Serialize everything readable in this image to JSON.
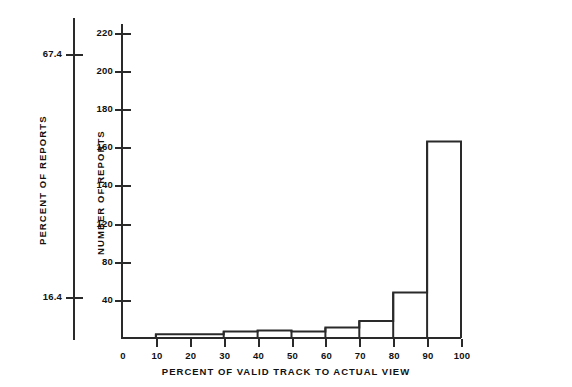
{
  "chart_data": {
    "type": "bar",
    "title": "",
    "subtitle": "",
    "xlabel": "PERCENT OF VALID TRACK TO ACTUAL VIEW",
    "ylabel": "NUMBER OF REPORTS",
    "secondary_ylabel": "PERCENT OF REPORTS",
    "grid": false,
    "legend": null,
    "bin_edges": [
      0,
      10,
      20,
      30,
      40,
      50,
      60,
      70,
      80,
      90,
      100
    ],
    "categories": [
      "0-10",
      "10-20",
      "20-30",
      "30-40",
      "40-50",
      "50-60",
      "60-70",
      "70-80",
      "80-90",
      "90-100"
    ],
    "values": [
      0,
      4,
      4,
      7,
      8,
      7,
      11,
      18,
      48,
      207
    ],
    "xlim": [
      0,
      100
    ],
    "ylim": [
      0,
      228
    ],
    "x_ticks": [
      0,
      10,
      20,
      30,
      40,
      50,
      60,
      70,
      80,
      90,
      100
    ],
    "x_tick_labels": [
      "0",
      "10",
      "20",
      "30",
      "40",
      "50",
      "60",
      "70",
      "80",
      "90",
      "100"
    ],
    "y_ticks": [
      40,
      80,
      120,
      140,
      160,
      180,
      200,
      220
    ],
    "y_tick_labels": [
      "40",
      "80",
      "120",
      "140",
      "160",
      "180",
      "200",
      "220"
    ],
    "secondary_y_tick_labels": [
      "67.4",
      "16.4"
    ],
    "secondary_y_tick_values": [
      67.4,
      16.4
    ]
  },
  "axes": {
    "percent_axis": {
      "title": "PERCENT OF REPORTS",
      "labels": [
        "67.4",
        "16.4"
      ]
    },
    "number_axis": {
      "title": "NUMBER OF REPORTS",
      "labels": [
        "220",
        "200",
        "180",
        "160",
        "140",
        "120",
        "80",
        "40"
      ]
    },
    "x_axis": {
      "title": "PERCENT OF VALID TRACK TO ACTUAL VIEW",
      "labels": [
        "0",
        "10",
        "20",
        "30",
        "40",
        "50",
        "60",
        "70",
        "80",
        "90",
        "100"
      ]
    }
  },
  "style": {
    "ink": "#2a2a2a",
    "background": "#ffffff"
  }
}
